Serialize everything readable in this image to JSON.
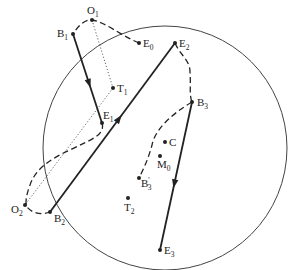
{
  "diagram": {
    "colors": {
      "line": "#222222",
      "circle": "#444444",
      "background": "#ffffff"
    },
    "boundary_circle": {
      "cx": 165,
      "cy": 148,
      "r": 122
    },
    "points": [
      {
        "id": "O1",
        "base": "O",
        "sub": "1",
        "x": 92,
        "y": 20,
        "lx": 87,
        "ly": 14
      },
      {
        "id": "B1",
        "base": "B",
        "sub": "1",
        "x": 73,
        "y": 34,
        "lx": 57,
        "ly": 37
      },
      {
        "id": "E0",
        "base": "E",
        "sub": "0",
        "x": 139,
        "y": 43,
        "lx": 143,
        "ly": 47
      },
      {
        "id": "T1",
        "base": "T",
        "sub": "1",
        "x": 113,
        "y": 88,
        "lx": 117,
        "ly": 92
      },
      {
        "id": "E1",
        "base": "E",
        "sub": "1",
        "x": 102,
        "y": 123,
        "lx": 103,
        "ly": 119
      },
      {
        "id": "E2",
        "base": "E",
        "sub": "2",
        "x": 175,
        "y": 43,
        "lx": 179,
        "ly": 47
      },
      {
        "id": "B3",
        "base": "B",
        "sub": "3",
        "x": 192,
        "y": 102,
        "lx": 197,
        "ly": 106
      },
      {
        "id": "C",
        "base": "C",
        "sub": "",
        "x": 165,
        "y": 142,
        "lx": 169,
        "ly": 146
      },
      {
        "id": "M0",
        "base": "M",
        "sub": "0",
        "x": 160,
        "y": 156,
        "lx": 157,
        "ly": 168
      },
      {
        "id": "B3p",
        "base": "B",
        "sub": "3",
        "prime": "'",
        "x": 139,
        "y": 178,
        "lx": 141,
        "ly": 187
      },
      {
        "id": "T2",
        "base": "T",
        "sub": "2",
        "x": 128,
        "y": 198,
        "lx": 124,
        "ly": 211
      },
      {
        "id": "O2",
        "base": "O",
        "sub": "2",
        "x": 25,
        "y": 205,
        "lx": 11,
        "ly": 213
      },
      {
        "id": "B2",
        "base": "B",
        "sub": "2",
        "x": 50,
        "y": 212,
        "lx": 54,
        "ly": 222
      },
      {
        "id": "E3",
        "base": "E",
        "sub": "3",
        "x": 160,
        "y": 250,
        "lx": 164,
        "ly": 254
      }
    ],
    "solid_arrows": [
      {
        "from": "B1",
        "to": "E1"
      },
      {
        "from": "B2",
        "to": "E2"
      },
      {
        "from": "B3",
        "to": "E3"
      }
    ],
    "dashed_paths": [
      {
        "id": "E0-O1-B1",
        "d": "M139,43 C120,35 105,22 92,20 C85,19 78,26 73,34"
      },
      {
        "id": "E1-O2-B2",
        "d": "M102,123 C106,135 90,140 70,150 C48,160 35,170 30,185 C26,196 25,203 27,207 C33,214 42,215 50,212"
      },
      {
        "id": "E2-B3",
        "d": "M175,43 C180,55 190,60 190,72 C191,85 189,95 192,102"
      },
      {
        "id": "B3-B3p",
        "d": "M192,102 C170,115 155,130 152,145 C148,160 143,170 139,178"
      }
    ],
    "dotted_paths": [
      {
        "id": "O1-T1",
        "d": "M92,20 L113,88"
      },
      {
        "id": "T1-O2",
        "d": "M113,88 L25,205"
      }
    ]
  }
}
